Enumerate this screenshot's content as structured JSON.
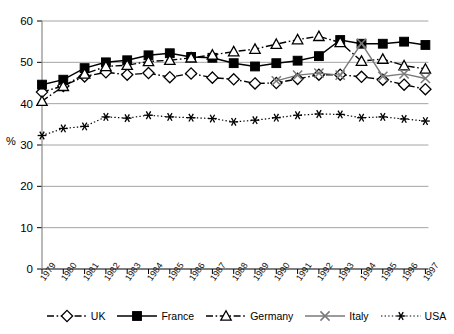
{
  "chart_data": {
    "type": "line",
    "title": "",
    "xlabel": "",
    "ylabel": "%",
    "ylim": [
      0,
      60
    ],
    "ytick_step": 10,
    "yticks": [
      0,
      10,
      20,
      30,
      40,
      50,
      60
    ],
    "grid": "horizontal",
    "legend_position": "bottom",
    "categories": [
      "1979",
      "1980",
      "1981",
      "1982",
      "1983",
      "1984",
      "1985",
      "1986",
      "1987",
      "1988",
      "1989",
      "1990",
      "1991",
      "1992",
      "1993",
      "1994",
      "1995",
      "1996",
      "1997"
    ],
    "series": [
      {
        "name": "UK",
        "marker": "open-diamond",
        "line_style": "dash-dot",
        "color": "#000000",
        "values": [
          42.8,
          44.3,
          46.6,
          47.6,
          47.0,
          47.4,
          46.4,
          47.3,
          46.3,
          45.9,
          44.9,
          45.0,
          46.0,
          47.0,
          47.0,
          46.5,
          45.8,
          44.6,
          43.5
        ]
      },
      {
        "name": "France",
        "marker": "filled-square",
        "line_style": "solid",
        "color": "#000000",
        "values": [
          44.6,
          45.8,
          48.6,
          50.0,
          50.5,
          51.7,
          52.2,
          51.3,
          51.1,
          49.8,
          49.0,
          49.8,
          50.4,
          51.5,
          55.4,
          54.5,
          54.5,
          55.0,
          54.2
        ]
      },
      {
        "name": "Germany",
        "marker": "open-triangle",
        "line_style": "dash-dot",
        "color": "#000000",
        "values": [
          40.6,
          44.2,
          47.2,
          49.0,
          49.3,
          50.2,
          50.5,
          51.1,
          51.8,
          52.6,
          53.2,
          54.4,
          55.5,
          56.3,
          54.8,
          50.3,
          50.8,
          49.2,
          48.4
        ]
      },
      {
        "name": "Italy",
        "marker": "cross-x",
        "line_style": "solid",
        "color": "#7a7a7a",
        "values": [
          null,
          null,
          null,
          null,
          null,
          null,
          null,
          null,
          null,
          null,
          null,
          45.5,
          46.9,
          47.4,
          46.9,
          54.6,
          46.6,
          47.2,
          46.1
        ]
      },
      {
        "name": "USA",
        "marker": "asterisk",
        "line_style": "dotted",
        "color": "#000000",
        "values": [
          32.3,
          34.0,
          34.5,
          36.8,
          36.5,
          37.2,
          36.8,
          36.6,
          36.4,
          35.6,
          36.0,
          36.6,
          37.2,
          37.5,
          37.4,
          36.6,
          36.8,
          36.3,
          35.8
        ]
      }
    ]
  },
  "legend": {
    "items": [
      {
        "label": "UK"
      },
      {
        "label": "France"
      },
      {
        "label": "Germany"
      },
      {
        "label": "Italy"
      },
      {
        "label": "USA"
      }
    ]
  }
}
